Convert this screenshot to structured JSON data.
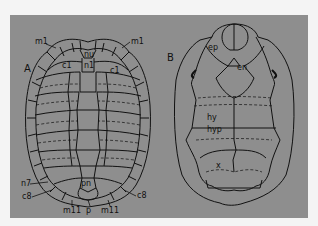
{
  "figure": {
    "panel_color": "#8e8e8e",
    "line_color": "#111111",
    "panels": [
      {
        "id": "A",
        "label": "A",
        "subject": "carapace",
        "annotations": {
          "m1_left": "m1",
          "m1_right": "m1",
          "nu": "nu",
          "n1": "n1",
          "c1_left": "c1",
          "c1_right": "c1",
          "n7": "n7",
          "pn": "pn",
          "c8_left": "c8",
          "c8_right": "c8",
          "m11_left": "m11",
          "p": "p",
          "m11_right": "m11"
        }
      },
      {
        "id": "B",
        "label": "B",
        "subject": "plastron",
        "annotations": {
          "ep": "ep",
          "en": "en",
          "hy": "hy",
          "hyp": "hyp",
          "x": "x"
        }
      }
    ]
  }
}
